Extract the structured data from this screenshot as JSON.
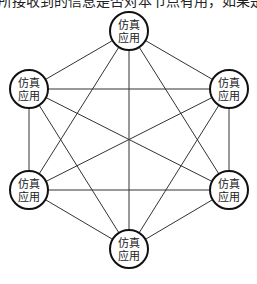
{
  "top_text": "所接收到的信息是否对本节点有用，如果是无用",
  "diagram": {
    "type": "complete-graph",
    "node_label_line1": "仿真",
    "node_label_line2": "应用",
    "nodes": [
      {
        "id": "top",
        "line1": "仿真",
        "line2": "应用"
      },
      {
        "id": "upper-right",
        "line1": "仿真",
        "line2": "应用"
      },
      {
        "id": "lower-right",
        "line1": "仿真",
        "line2": "应用"
      },
      {
        "id": "bottom",
        "line1": "仿真",
        "line2": "应用"
      },
      {
        "id": "lower-left",
        "line1": "仿真",
        "line2": "应用"
      },
      {
        "id": "upper-left",
        "line1": "仿真",
        "line2": "应用"
      }
    ],
    "edges": [
      [
        "top",
        "upper-right"
      ],
      [
        "top",
        "lower-right"
      ],
      [
        "top",
        "bottom"
      ],
      [
        "top",
        "lower-left"
      ],
      [
        "top",
        "upper-left"
      ],
      [
        "upper-right",
        "lower-right"
      ],
      [
        "upper-right",
        "bottom"
      ],
      [
        "upper-right",
        "lower-left"
      ],
      [
        "upper-right",
        "upper-left"
      ],
      [
        "lower-right",
        "bottom"
      ],
      [
        "lower-right",
        "lower-left"
      ],
      [
        "lower-right",
        "upper-left"
      ],
      [
        "bottom",
        "lower-left"
      ],
      [
        "bottom",
        "upper-left"
      ],
      [
        "lower-left",
        "upper-left"
      ]
    ]
  }
}
